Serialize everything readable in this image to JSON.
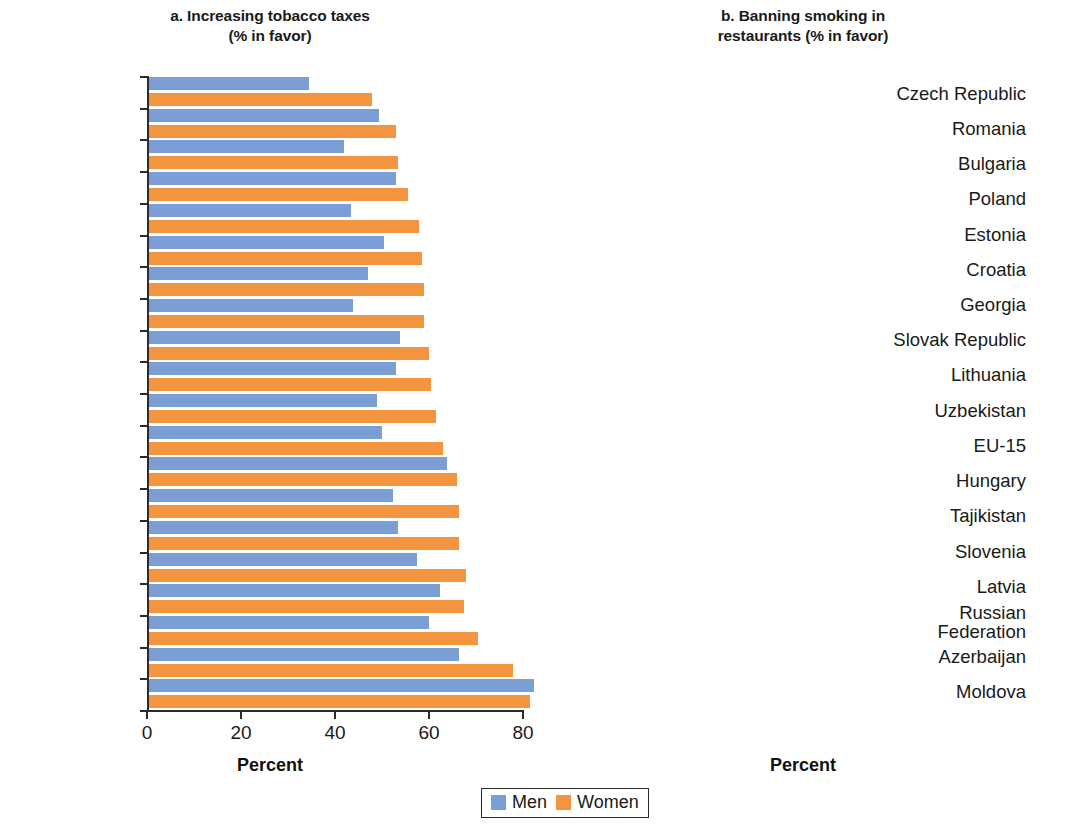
{
  "figure": {
    "axis_title": "Percent",
    "legend": [
      {
        "label": "Men",
        "color": "#7b9fd4"
      },
      {
        "label": "Women",
        "color": "#f3953f"
      }
    ]
  },
  "panels": {
    "a": {
      "title_line1": "a. Increasing tobacco taxes",
      "title_line2": "(% in favor)",
      "xlabel": "Percent",
      "xticks": [
        "0",
        "20",
        "40",
        "60",
        "80"
      ]
    },
    "b": {
      "title_line1": "b. Banning smoking in",
      "title_line2": "restaurants (% in favor)",
      "xlabel": "Percent",
      "xticks": [
        "0",
        "20",
        "40",
        "60",
        "80"
      ]
    }
  },
  "chart_data": [
    {
      "type": "bar",
      "orientation": "horizontal",
      "title": "a. Increasing tobacco taxes (% in favor)",
      "xlabel": "Percent",
      "ylabel": "",
      "xlim": [
        0,
        80
      ],
      "xticks": [
        0,
        20,
        40,
        60,
        80
      ],
      "grid": false,
      "legend": [
        "Men",
        "Women"
      ],
      "legend_position": "bottom-center",
      "categories": [
        "Georgia",
        "Poland",
        "Lithuania",
        "Bulgaria",
        "Latvia",
        "Hungary",
        "Russian Federation",
        "Estonia",
        "Macedonia, FYR",
        "EU-15",
        "Croatia",
        "Romania",
        "Uzbekistan",
        "Czech Republic",
        "Moldova",
        "Slovak Republic",
        "Slovenia",
        "Azerbaijan",
        "Turkey",
        "Tajikistan"
      ],
      "series": [
        {
          "name": "Men",
          "color": "#7b9fd4",
          "values": [
            34,
            49,
            41.5,
            52.5,
            43,
            50,
            46.5,
            43.5,
            53.5,
            52.5,
            48.5,
            49.5,
            63.5,
            52,
            53,
            57,
            62,
            59.5,
            66,
            82
          ]
        },
        {
          "name": "Women",
          "color": "#f3953f",
          "values": [
            47.5,
            52.5,
            53,
            55,
            57.5,
            58,
            58.5,
            58.5,
            59.5,
            60,
            61,
            62.5,
            65.5,
            66,
            66,
            67.5,
            67,
            70,
            77.5,
            81
          ]
        }
      ]
    },
    {
      "type": "bar",
      "orientation": "horizontal",
      "title": "b. Banning smoking in restaurants (% in favor)",
      "xlabel": "Percent",
      "ylabel": "",
      "xlim": [
        0,
        80
      ],
      "xticks": [
        0,
        20,
        40,
        60,
        80
      ],
      "grid": false,
      "legend": [
        "Men",
        "Women"
      ],
      "legend_position": "bottom-center",
      "categories": [
        "Czech Republic",
        "Romania",
        "Bulgaria",
        "Poland",
        "Estonia",
        "Croatia",
        "Georgia",
        "Slovak Republic",
        "Lithuania",
        "Uzbekistan",
        "EU-15",
        "Hungary",
        "Tajikistan",
        "Slovenia",
        "Latvia",
        "Russian Federation",
        "Azerbaijan",
        "Moldova"
      ],
      "series": [
        {
          "name": "Men",
          "color": "#7b9fd4",
          "values": [
            29,
            35.5,
            35,
            41.5,
            42,
            47.5,
            43,
            42.5,
            41,
            48,
            55,
            54.5,
            55.5,
            52,
            52,
            44.5,
            49.5,
            73.5
          ]
        },
        {
          "name": "Women",
          "color": "#f3953f",
          "values": [
            35,
            45.5,
            46.5,
            48.5,
            48.5,
            53,
            55.5,
            56.5,
            58,
            59,
            59.5,
            61,
            62,
            63,
            64.5,
            66,
            66.5,
            77.5
          ]
        }
      ]
    }
  ]
}
